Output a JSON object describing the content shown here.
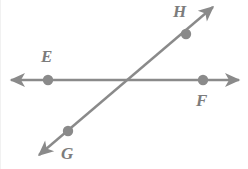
{
  "figure": {
    "width": 248,
    "height": 169,
    "background_color": "#ffffff",
    "stroke_color": "#8a8a8a",
    "label_color": "#7c7c7c",
    "stroke_width": 2.4,
    "dot_radius": 5.2
  },
  "lines": [
    {
      "name": "line-EF",
      "description": "horizontal line through E and F",
      "x1": 11,
      "y1": 80,
      "x2": 239,
      "y2": 80,
      "arrow_start": true,
      "arrow_end": true
    },
    {
      "name": "line-GH",
      "description": "diagonal line through G and H",
      "x1": 39,
      "y1": 155,
      "x2": 213,
      "y2": 7,
      "arrow_start": true,
      "arrow_end": true
    }
  ],
  "points": [
    {
      "id": "E",
      "label": "E",
      "cx": 48,
      "cy": 80,
      "label_x": 41,
      "label_y": 48
    },
    {
      "id": "F",
      "label": "F",
      "cx": 203,
      "cy": 80,
      "label_x": 196,
      "label_y": 92
    },
    {
      "id": "H",
      "label": "H",
      "cx": 186,
      "cy": 34,
      "label_x": 173,
      "label_y": 3
    },
    {
      "id": "G",
      "label": "G",
      "cx": 68,
      "cy": 131,
      "label_x": 61,
      "label_y": 145
    }
  ],
  "intersection": {
    "name": "intersection-point",
    "x": 128,
    "y": 80
  }
}
